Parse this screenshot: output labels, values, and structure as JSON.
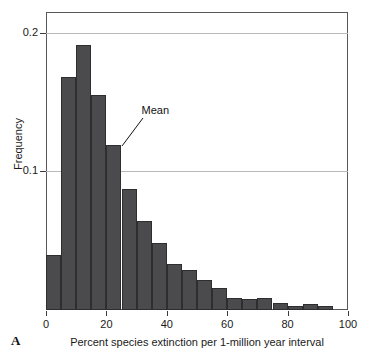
{
  "panel": {
    "letter": "A"
  },
  "chart_data": {
    "type": "bar",
    "title": "",
    "subtitle": "",
    "xlabel": "Percent species extinction per 1-million year interval",
    "ylabel": "Frequency",
    "xlim": [
      0,
      100
    ],
    "ylim": [
      0,
      0.215
    ],
    "grid": true,
    "legend": null,
    "bin_width": 5,
    "x_ticks": [
      0,
      20,
      40,
      60,
      80,
      100
    ],
    "x_tick_labels": [
      "0",
      "20",
      "40",
      "60",
      "80",
      "100"
    ],
    "y_ticks": [
      0.1,
      0.2
    ],
    "y_tick_labels": [
      "0.1",
      "0.2"
    ],
    "bar_color": "#4b4b4d",
    "bar_edge_color": "#2e2e30",
    "grid_color": "#b9b9bb",
    "categories": [
      "0-5",
      "5-10",
      "10-15",
      "15-20",
      "20-25",
      "25-30",
      "30-35",
      "35-40",
      "40-45",
      "45-50",
      "50-55",
      "55-60",
      "60-65",
      "65-70",
      "70-75",
      "75-80",
      "80-85",
      "85-90",
      "90-95",
      "95-100"
    ],
    "bin_starts": [
      0,
      5,
      10,
      15,
      20,
      25,
      30,
      35,
      40,
      45,
      50,
      55,
      60,
      65,
      70,
      75,
      80,
      85,
      90,
      95
    ],
    "values": [
      0.04,
      0.168,
      0.191,
      0.155,
      0.119,
      0.087,
      0.064,
      0.048,
      0.033,
      0.029,
      0.022,
      0.016,
      0.009,
      0.008,
      0.009,
      0.005,
      0.003,
      0.004,
      0.003,
      0.0
    ],
    "annotations": [
      {
        "label": "Mean",
        "points_to_bin": "20-25",
        "points_to_x": 25,
        "points_to_y": 0.119
      }
    ]
  }
}
